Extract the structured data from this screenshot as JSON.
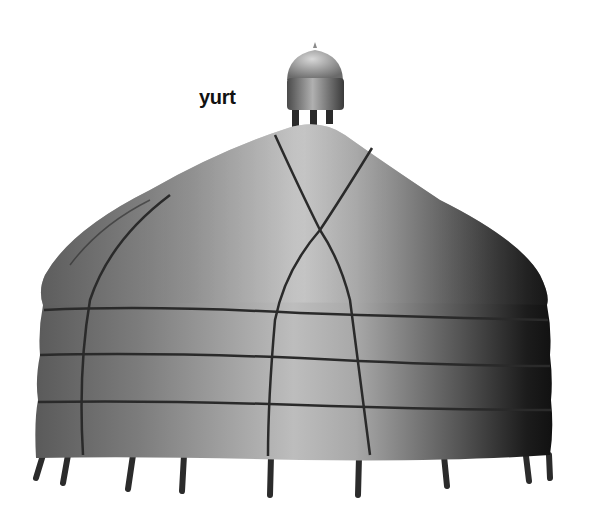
{
  "illustration": {
    "subject": "yurt",
    "label": "yurt",
    "colors": {
      "background": "#ffffff",
      "highlight": "#cfcfcf",
      "midtone": "#8a8a8a",
      "shadow": "#1a1a1a",
      "strap": "#2a2a2a",
      "label": "#111111"
    },
    "parts": [
      "crown",
      "roof",
      "wall",
      "straps",
      "legs"
    ],
    "wall_bands": 3,
    "leg_count": 10
  }
}
